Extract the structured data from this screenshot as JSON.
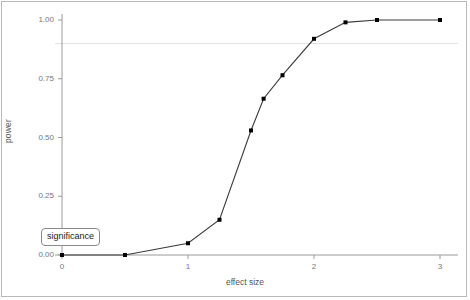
{
  "chart_data": {
    "type": "line",
    "title": "",
    "xlabel": "effect size",
    "ylabel": "power",
    "xlim": [
      -0.13,
      3.15
    ],
    "ylim": [
      -0.035,
      1.06
    ],
    "xticks": [
      "0",
      "1",
      "2",
      "3"
    ],
    "xtick_values": [
      0,
      1,
      2,
      3
    ],
    "yticks": [
      "0.00",
      "0.25",
      "0.50",
      "0.75",
      "1.00"
    ],
    "ytick_values": [
      0.0,
      0.25,
      0.5,
      0.75,
      1.0
    ],
    "grid": false,
    "legend": "none",
    "markers": "filled-square",
    "line_color": "#3a3a3a",
    "marker_color": "#000000",
    "series": [
      {
        "name": "power",
        "x": [
          0,
          0.5,
          1.0,
          1.25,
          1.5,
          1.6,
          1.75,
          2.0,
          2.25,
          2.5,
          3.0
        ],
        "values": [
          0.0,
          0.0,
          0.05,
          0.15,
          0.53,
          0.665,
          0.765,
          0.92,
          0.99,
          1.0,
          1.0
        ]
      }
    ],
    "annotations": [
      {
        "name": "significance-threshold-line",
        "kind": "hline",
        "y": 0.9,
        "label": "significance",
        "color": "#e2e2e2",
        "label_x": 0.23,
        "label_y": 0.115
      }
    ]
  }
}
